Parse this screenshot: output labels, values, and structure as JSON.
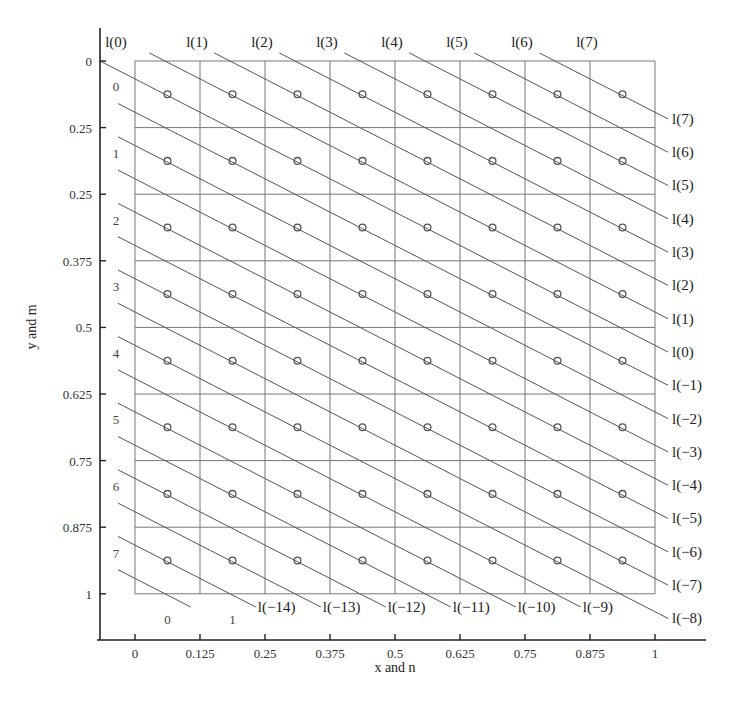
{
  "chart_data": {
    "type": "diagram",
    "title": "",
    "xlabel": "x and n",
    "ylabel": "y and m",
    "x_ticks": [
      "0",
      "0.125",
      "0.25",
      "0.375",
      "0.5",
      "0.625",
      "0.75",
      "0.875",
      "1"
    ],
    "y_ticks": [
      "0",
      "0.25",
      "0.25",
      "0.375",
      "0.5",
      "0.625",
      "0.75",
      "0.875",
      "1"
    ],
    "grid": {
      "cols": 8,
      "rows": 8
    },
    "column_index_labels": [
      "0",
      "1"
    ],
    "row_index_labels": [
      "0",
      "1",
      "2",
      "3",
      "4",
      "5",
      "6",
      "7"
    ],
    "sample_points": "circle at center of each of 8x8 cells",
    "top_line_labels": [
      "l(0)",
      "l(1)",
      "l(2)",
      "l(3)",
      "l(4)",
      "l(5)",
      "l(6)",
      "l(7)"
    ],
    "right_line_labels": [
      "l(7)",
      "l(6)",
      "l(5)",
      "l(4)",
      "l(3)",
      "l(2)",
      "l(1)",
      "l(0)",
      "l(−1)",
      "l(−2)",
      "l(−3)",
      "l(−4)",
      "l(−5)",
      "l(−6)",
      "l(−7)",
      "l(−8)"
    ],
    "bottom_line_labels": [
      "l(−14)",
      "l(−13)",
      "l(−12)",
      "l(−11)",
      "l(−10)",
      "l(−9)"
    ],
    "line_index_range": [
      -15,
      7
    ]
  },
  "colors": {
    "line": "#555555",
    "grid": "#777777",
    "axis": "#222222",
    "point": "#555555"
  }
}
